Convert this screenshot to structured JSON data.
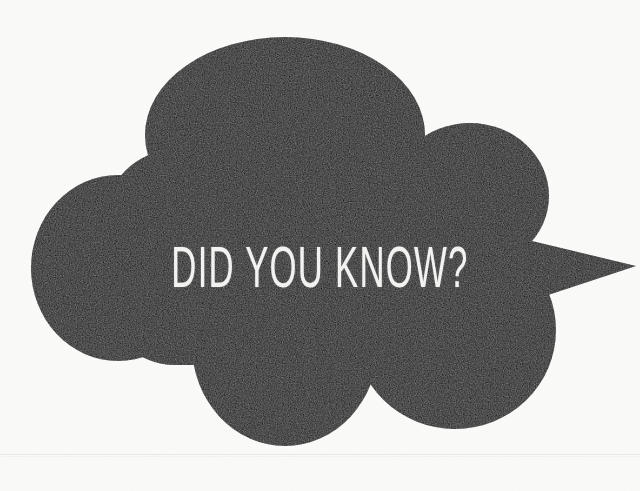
{
  "image": {
    "kind": "scanned-graphic",
    "width": 640,
    "height": 491,
    "background_color": "#fbfbfa",
    "ink_color": "#0d0d0d",
    "text_color": "#f4f4f2"
  },
  "headline": {
    "text": "DID YOU KNOW?",
    "color": "#f4f4f2",
    "style": "condensed-uppercase-sans"
  },
  "cloud": {
    "name": "thought-bubble",
    "fill": "#0d0d0d",
    "description": "Large cloud / thought-bubble silhouette with a pointed tail spike on the right side",
    "lobes": [
      {
        "name": "top-lobe",
        "cx": 285,
        "cy": 135,
        "rx": 140,
        "ry": 98
      },
      {
        "name": "upper-right-lobe",
        "cx": 470,
        "cy": 195,
        "rx": 78,
        "ry": 72
      },
      {
        "name": "left-lobe",
        "cx": 118,
        "cy": 268,
        "rx": 86,
        "ry": 92
      },
      {
        "name": "bottom-left-lobe",
        "cx": 285,
        "cy": 345,
        "rx": 92,
        "ry": 100
      },
      {
        "name": "bottom-right-lobe",
        "cx": 455,
        "cy": 330,
        "rx": 100,
        "ry": 98
      }
    ],
    "tail": {
      "name": "tail-spike",
      "tip_x": 636,
      "tip_y": 266,
      "base_top_y": 232,
      "base_bottom_y": 318
    }
  },
  "marks": {
    "fold_line_y": 454,
    "fold_line_color": "#e8e8e6"
  }
}
